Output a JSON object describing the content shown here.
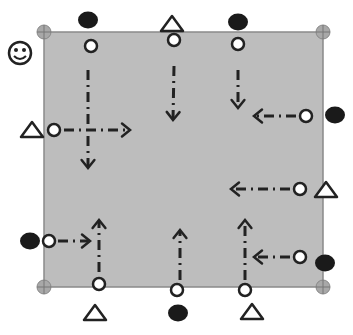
{
  "diagram": {
    "type": "drill-layout",
    "field": {
      "x": 44,
      "y": 32,
      "width": 279,
      "height": 255,
      "fill": "#bdbdbd",
      "stroke": "#8a8a8a"
    },
    "colors": {
      "ink": "#222222",
      "cone": "#ffffff",
      "ball": "#1a1a1a",
      "corner": "#a8a8a8"
    },
    "corner_markers": [
      {
        "x": 44,
        "y": 32
      },
      {
        "x": 323,
        "y": 32
      },
      {
        "x": 44,
        "y": 287
      },
      {
        "x": 323,
        "y": 287
      }
    ],
    "smiley": {
      "x": 20,
      "y": 53
    },
    "balls": [
      {
        "x": 88,
        "y": 20
      },
      {
        "x": 238,
        "y": 22
      },
      {
        "x": 335,
        "y": 115
      },
      {
        "x": 30,
        "y": 241
      },
      {
        "x": 325,
        "y": 263
      },
      {
        "x": 178,
        "y": 313
      }
    ],
    "triangles": [
      {
        "x": 172,
        "y": 24
      },
      {
        "x": 32,
        "y": 130
      },
      {
        "x": 326,
        "y": 190
      },
      {
        "x": 95,
        "y": 313
      },
      {
        "x": 252,
        "y": 312
      }
    ],
    "cones": [
      {
        "x": 91,
        "y": 46
      },
      {
        "x": 174,
        "y": 40
      },
      {
        "x": 238,
        "y": 44
      },
      {
        "x": 306,
        "y": 116
      },
      {
        "x": 54,
        "y": 130
      },
      {
        "x": 300,
        "y": 189
      },
      {
        "x": 49,
        "y": 241
      },
      {
        "x": 300,
        "y": 257
      },
      {
        "x": 99,
        "y": 284
      },
      {
        "x": 177,
        "y": 290
      },
      {
        "x": 245,
        "y": 290
      }
    ],
    "arrows": [
      {
        "x1": 88,
        "y1": 70,
        "x2": 88,
        "y2": 168
      },
      {
        "x1": 174,
        "y1": 66,
        "x2": 173,
        "y2": 120
      },
      {
        "x1": 238,
        "y1": 70,
        "x2": 238,
        "y2": 108
      },
      {
        "x1": 296,
        "y1": 116,
        "x2": 254,
        "y2": 116
      },
      {
        "x1": 64,
        "y1": 130,
        "x2": 130,
        "y2": 130
      },
      {
        "x1": 290,
        "y1": 189,
        "x2": 231,
        "y2": 189
      },
      {
        "x1": 58,
        "y1": 241,
        "x2": 90,
        "y2": 241
      },
      {
        "x1": 290,
        "y1": 257,
        "x2": 254,
        "y2": 257
      },
      {
        "x1": 99,
        "y1": 272,
        "x2": 99,
        "y2": 220
      },
      {
        "x1": 180,
        "y1": 280,
        "x2": 180,
        "y2": 230
      },
      {
        "x1": 245,
        "y1": 280,
        "x2": 245,
        "y2": 220
      }
    ]
  }
}
